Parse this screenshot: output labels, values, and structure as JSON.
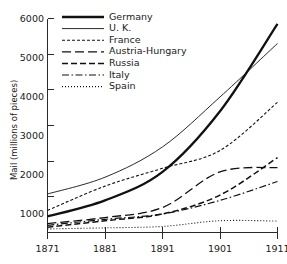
{
  "chart_data": {
    "type": "line",
    "title": "",
    "xlabel": "",
    "ylabel": "Mail (millions of pieces)",
    "x": [
      1871,
      1881,
      1891,
      1901,
      1911
    ],
    "xtick_labels": [
      "1871",
      "1881",
      "1891",
      "1901",
      "1911"
    ],
    "ytick_labels": [
      "1000",
      "2000",
      "3000",
      "4000",
      "5000",
      "6000"
    ],
    "ytick_values": [
      1000,
      2000,
      3000,
      4000,
      5000,
      6000
    ],
    "xlim": [
      1871,
      1911
    ],
    "ylim": [
      0,
      6000
    ],
    "grid": false,
    "legend_position": "top-left",
    "series": [
      {
        "name": "Germany",
        "style": "thick-solid",
        "values": [
          450,
          900,
          1700,
          3400,
          5850
        ]
      },
      {
        "name": "U. K.",
        "style": "thin-solid",
        "values": [
          1080,
          1550,
          2400,
          3800,
          5300
        ]
      },
      {
        "name": "France",
        "style": "short-dash",
        "values": [
          620,
          1300,
          1800,
          2300,
          3650
        ]
      },
      {
        "name": "Austria-Hungary",
        "style": "long-dash",
        "values": [
          250,
          420,
          700,
          1700,
          1820
        ]
      },
      {
        "name": "Russia",
        "style": "medium-dash",
        "values": [
          150,
          330,
          520,
          1050,
          2100
        ]
      },
      {
        "name": "Italy",
        "style": "dash-dot",
        "values": [
          200,
          370,
          520,
          900,
          1430
        ]
      },
      {
        "name": "Spain",
        "style": "dotted",
        "values": [
          100,
          130,
          170,
          330,
          320
        ]
      }
    ]
  },
  "axis": {
    "y_title": "Mail (millions of pieces)"
  },
  "colors": {
    "ink": "#111111",
    "background": "#ffffff"
  }
}
